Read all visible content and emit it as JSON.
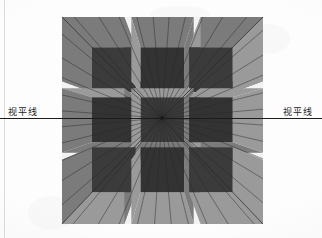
{
  "page": {
    "background_color": "#fdfdfd"
  },
  "horizon": {
    "label_left": "视平线",
    "label_right": "视平线",
    "line_color": "#1b1b1b",
    "y_px": 118
  },
  "illustration": {
    "name": "one-point-perspective-grid",
    "frame": {
      "x": 62,
      "y": 17,
      "width": 201,
      "height": 207
    },
    "vanishing_point": {
      "x": 100,
      "y": 101
    },
    "colors": {
      "outer_face": "#8a8a8a",
      "outer_face_shadow": "#7b7b7b",
      "inner_face": "#3b3b3b",
      "inner_face_dark": "#333333",
      "gap": "#f2f2f2",
      "ray": "#2a2a2a",
      "bevel_light": "#9a9a9a"
    },
    "grid": {
      "rows": 3,
      "cols": 3,
      "cell_labels": [
        "top-left",
        "top-center",
        "top-right",
        "middle-left",
        "middle-center",
        "middle-right",
        "bottom-left",
        "bottom-center",
        "bottom-right"
      ]
    },
    "ray_count": 40
  }
}
